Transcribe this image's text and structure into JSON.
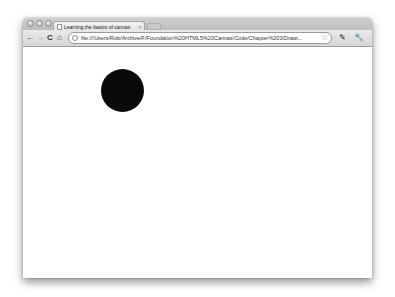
{
  "browser": {
    "tab": {
      "title": "Learning the basics of canvas",
      "close": "×"
    },
    "toolbar": {
      "back": "←",
      "forward": "→",
      "reload": "C",
      "home": "⌂",
      "url": "file:///Users/Rob/Archive/F/Foundation%20HTML5%20Canvas/Code/Chapter%203/Drawi...",
      "bookmark_star": "☆",
      "page_menu": "✎",
      "wrench_menu": "🔧"
    }
  },
  "canvas": {
    "shapes": [
      {
        "type": "circle",
        "fill": "#0a0a0a",
        "cx": 122,
        "cy": 90,
        "r": 22
      }
    ]
  }
}
